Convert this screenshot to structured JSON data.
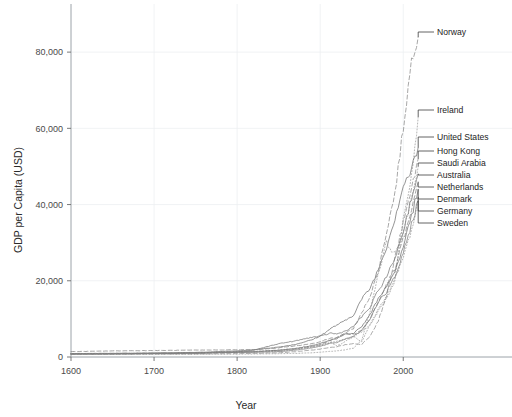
{
  "chart_data": {
    "type": "line",
    "title": "",
    "xlabel": "Year",
    "ylabel": "GDP per Capita (USD)",
    "xlim": [
      1600,
      2025
    ],
    "ylim": [
      0,
      90000
    ],
    "grid": true,
    "legend_position": "right-inline-labels",
    "x_ticks": [
      "1600",
      "1700",
      "1800",
      "1900",
      "2000"
    ],
    "x_tick_values": [
      1600,
      1700,
      1800,
      1900,
      2000
    ],
    "y_ticks": [
      "0",
      "20,000",
      "40,000",
      "60,000",
      "80,000"
    ],
    "y_tick_values": [
      0,
      20000,
      40000,
      60000,
      80000
    ],
    "x": [
      1600,
      1650,
      1700,
      1750,
      1800,
      1820,
      1850,
      1870,
      1890,
      1900,
      1913,
      1920,
      1930,
      1940,
      1950,
      1960,
      1970,
      1980,
      1990,
      2000,
      2010,
      2018
    ],
    "series": [
      {
        "name": "Norway",
        "label": "Norway",
        "style": "dashed",
        "color": "#8a8a8a",
        "values": [
          900,
          950,
          1000,
          1100,
          1300,
          1400,
          1700,
          2100,
          2700,
          3200,
          4500,
          5000,
          6300,
          7500,
          11500,
          16000,
          22500,
          33000,
          43000,
          60000,
          78000,
          84000
        ]
      },
      {
        "name": "Ireland",
        "label": "Ireland",
        "style": "dotted",
        "color": "#9a9a9a",
        "values": [
          800,
          850,
          900,
          1000,
          1400,
          1500,
          1800,
          2200,
          2800,
          3200,
          3900,
          4100,
          4800,
          5200,
          6600,
          8500,
          12000,
          15500,
          20000,
          37000,
          48000,
          63000
        ]
      },
      {
        "name": "United States",
        "label": "United States",
        "style": "solid",
        "color": "#707070",
        "values": [
          800,
          850,
          1000,
          1200,
          1600,
          1900,
          2600,
          3300,
          4500,
          5500,
          7500,
          8400,
          9500,
          11000,
          15200,
          18000,
          23000,
          29000,
          36500,
          45000,
          49000,
          55000
        ]
      },
      {
        "name": "Hong Kong",
        "label": "Hong Kong",
        "style": "dashed",
        "color": "#8f8f8f",
        "values": [
          700,
          720,
          750,
          800,
          900,
          950,
          1100,
          1400,
          1800,
          2100,
          2500,
          2700,
          3200,
          3500,
          3300,
          5500,
          9500,
          16000,
          26000,
          35000,
          44000,
          52000
        ]
      },
      {
        "name": "Saudi Arabia",
        "label": "Saudi Arabia",
        "style": "dotted",
        "color": "#9e9e9e",
        "values": [
          650,
          660,
          680,
          700,
          750,
          780,
          850,
          950,
          1100,
          1250,
          1500,
          1600,
          1900,
          2300,
          4500,
          12000,
          22000,
          30000,
          27000,
          32000,
          42000,
          50000
        ]
      },
      {
        "name": "Australia",
        "label": "Australia",
        "style": "solid",
        "color": "#787878",
        "values": [
          800,
          850,
          900,
          1000,
          1300,
          1800,
          3500,
          4200,
          5200,
          5400,
          6300,
          6000,
          6800,
          8000,
          10500,
          13000,
          17500,
          21000,
          26000,
          33000,
          42000,
          48000
        ]
      },
      {
        "name": "Netherlands",
        "label": "Netherlands",
        "style": "dashed",
        "color": "#858585",
        "values": [
          1400,
          1600,
          1700,
          1800,
          1900,
          1900,
          2400,
          2900,
          3500,
          4000,
          5000,
          5100,
          6200,
          6000,
          7000,
          10000,
          14500,
          19000,
          23000,
          31000,
          38000,
          46000
        ]
      },
      {
        "name": "Denmark",
        "label": "Denmark",
        "style": "solid",
        "color": "#6f6f6f",
        "values": [
          900,
          950,
          1000,
          1100,
          1300,
          1350,
          1800,
          2200,
          3000,
          3600,
          4500,
          4800,
          6000,
          6200,
          8000,
          11000,
          15500,
          18500,
          22500,
          29000,
          37000,
          44000
        ]
      },
      {
        "name": "Germany",
        "label": "Germany",
        "style": "dotted",
        "color": "#999999",
        "values": [
          900,
          950,
          1000,
          1100,
          1200,
          1300,
          1500,
          2000,
          2600,
          3000,
          3800,
          2900,
          4000,
          5500,
          4000,
          8500,
          12500,
          16000,
          20500,
          26000,
          33000,
          42000
        ]
      },
      {
        "name": "Sweden",
        "label": "Sweden",
        "style": "solid",
        "color": "#7d7d7d",
        "values": [
          800,
          850,
          950,
          1000,
          1200,
          1250,
          1400,
          1800,
          2400,
          2800,
          3600,
          3800,
          4700,
          5500,
          7000,
          10000,
          14500,
          17000,
          21000,
          27000,
          35000,
          41000
        ]
      }
    ],
    "annotations": [
      {
        "label": "Norway",
        "anchor_year": 2018,
        "y": 84000
      },
      {
        "label": "Ireland",
        "anchor_year": 2018,
        "y": 63000
      },
      {
        "label": "United States",
        "anchor_year": 2018,
        "y": 55000
      },
      {
        "label": "Hong Kong",
        "anchor_year": 2018,
        "y": 52000
      },
      {
        "label": "Saudi Arabia",
        "anchor_year": 2018,
        "y": 50000
      },
      {
        "label": "Australia",
        "anchor_year": 2018,
        "y": 48000
      },
      {
        "label": "Netherlands",
        "anchor_year": 2018,
        "y": 46000
      },
      {
        "label": "Denmark",
        "anchor_year": 2018,
        "y": 44000
      },
      {
        "label": "Germany",
        "anchor_year": 2018,
        "y": 42000
      },
      {
        "label": "Sweden",
        "anchor_year": 2018,
        "y": 41000
      }
    ]
  }
}
